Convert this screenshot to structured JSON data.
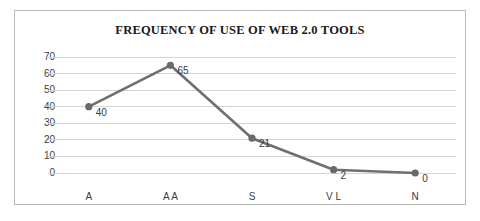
{
  "chart_data": {
    "type": "line",
    "title": "FREQUENCY OF USE OF WEB 2.0 TOOLS",
    "xlabel": "",
    "ylabel": "",
    "categories": [
      "A",
      "A A",
      "S",
      "V L",
      "N"
    ],
    "values": [
      40,
      65,
      21,
      2,
      0
    ],
    "point_labels": [
      "40",
      "65",
      "21",
      "2",
      "0"
    ],
    "ylim": [
      0,
      70
    ],
    "yticks": [
      0,
      10,
      20,
      30,
      40,
      50,
      60,
      70
    ],
    "ytick_labels": [
      "0",
      "10",
      "20",
      "30",
      "40",
      "50",
      "60",
      "70"
    ],
    "grid": true,
    "grid_axis": "y",
    "legend": false,
    "series": [
      {
        "name": "Frequency",
        "values": [
          40,
          65,
          21,
          2,
          0
        ],
        "color": "#6f6f6f",
        "marker": "circle",
        "line_width": 2.6
      }
    ],
    "colors": {
      "line": "#6f6f6f",
      "marker": "#6a6a6a",
      "grid": "#d4d4d4",
      "text": "#3d3d3d",
      "title": "#1a1a1a",
      "border": "#b9b9b9",
      "background": "#ffffff"
    }
  }
}
